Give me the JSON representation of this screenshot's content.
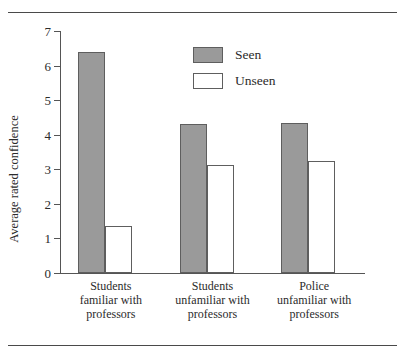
{
  "figure": {
    "top_rule": "horizontal-rule",
    "bottom_rule": "horizontal-rule"
  },
  "chart_data": {
    "type": "bar",
    "title": "",
    "xlabel": "",
    "ylabel": "Average rated confidence",
    "ylim": [
      0,
      7
    ],
    "yticks": [
      0,
      1,
      2,
      3,
      4,
      5,
      6,
      7
    ],
    "ytick_labels": [
      "0",
      "1",
      "2",
      "3",
      "4",
      "5",
      "6",
      "7"
    ],
    "grid": false,
    "legend_position": "upper center",
    "categories": [
      "Students\nfamiliar with\nprofessors",
      "Students\nunfamiliar with\nprofessors",
      "Police\nunfamiliar with\nprofessors"
    ],
    "series": [
      {
        "name": "Seen",
        "color": "#9a9a9a",
        "values": [
          6.4,
          4.3,
          4.35
        ]
      },
      {
        "name": "Unseen",
        "color": "#ffffff",
        "values": [
          1.35,
          3.12,
          3.25
        ]
      }
    ]
  }
}
